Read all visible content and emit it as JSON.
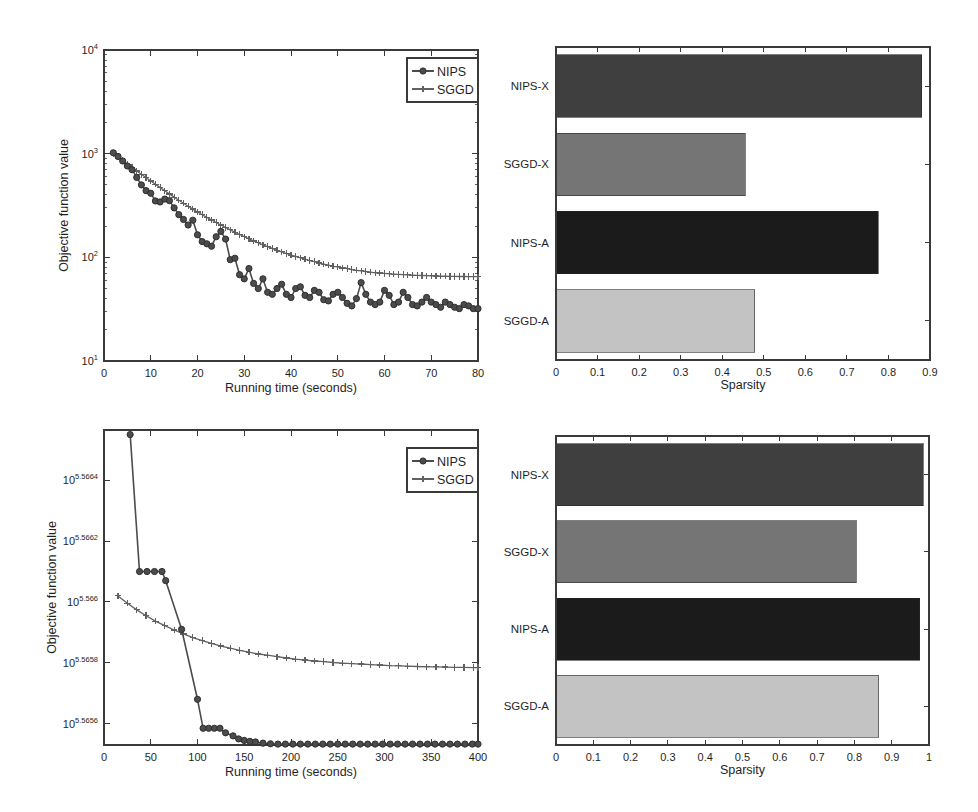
{
  "figure": {
    "background": "#ffffff",
    "text_color": "#1f1f1f",
    "frame_color": "#3a3a3a",
    "legend_labels": [
      "NIPS",
      "SGGD"
    ]
  },
  "chart_data": [
    {
      "id": "objective-vs-time-top",
      "position": "top-left",
      "type": "line",
      "xlabel": "Running time (seconds)",
      "ylabel": "Objective function value",
      "xlim": [
        0,
        80
      ],
      "xticks": [
        0,
        10,
        20,
        30,
        40,
        50,
        60,
        70,
        80
      ],
      "xtick_labels": [
        "0",
        "10",
        "20",
        "30",
        "40",
        "50",
        "60",
        "70",
        "80"
      ],
      "yscale": "log",
      "ylim_exponents": [
        1,
        4
      ],
      "ytick_exponents": [
        1,
        2,
        3,
        4
      ],
      "ytick_exponent_labels": [
        "1",
        "2",
        "3",
        "4"
      ],
      "log_minor_ticks": true,
      "legend_position": "top-right",
      "series": [
        {
          "name": "SGGD",
          "marker": "plus",
          "color": "#616161",
          "x": [
            2,
            3,
            4,
            5,
            6,
            7,
            8,
            9,
            10,
            11,
            12,
            13,
            14,
            15,
            16,
            17,
            18,
            19,
            20,
            21,
            22,
            23,
            24,
            25,
            26,
            27,
            28,
            29,
            30,
            31,
            32,
            33,
            34,
            35,
            36,
            37,
            38,
            39,
            40,
            41,
            42,
            43,
            44,
            45,
            46,
            47,
            48,
            49,
            50,
            51,
            52,
            53,
            54,
            55,
            56,
            57,
            58,
            59,
            60,
            61,
            62,
            63,
            64,
            65,
            66,
            67,
            68,
            69,
            70,
            71,
            72,
            73,
            74,
            75,
            76,
            77,
            78,
            79,
            80
          ],
          "y": [
            1000,
            925,
            857,
            793,
            735,
            681,
            632,
            587,
            545,
            507,
            471,
            439,
            409,
            381,
            356,
            333,
            311,
            292,
            274,
            258,
            243,
            229,
            217,
            205,
            194,
            184,
            175,
            166,
            158,
            151,
            144,
            138,
            132,
            127,
            122,
            117,
            113,
            109,
            105,
            102,
            99,
            96,
            93,
            91,
            88,
            86,
            84,
            82,
            81,
            79,
            78,
            76,
            75,
            74,
            73,
            72,
            71,
            70.5,
            70,
            69.4,
            68.9,
            68.5,
            68,
            67.7,
            67.3,
            67,
            66.8,
            66.5,
            66.3,
            66.1,
            65.9,
            65.8,
            65.6,
            65.5,
            65.4,
            65.3,
            65.2,
            65.1,
            65
          ]
        },
        {
          "name": "NIPS",
          "marker": "circle",
          "color": "#4c4c4c",
          "x": [
            2,
            3,
            4,
            5,
            6,
            7,
            8,
            9,
            10,
            11,
            12,
            13,
            14,
            15,
            16,
            17,
            18,
            19,
            20,
            21,
            22,
            23,
            24,
            25,
            26,
            27,
            28,
            29,
            30,
            31,
            32,
            33,
            34,
            35,
            36,
            37,
            38,
            39,
            40,
            41,
            42,
            43,
            44,
            45,
            46,
            47,
            48,
            49,
            50,
            51,
            52,
            53,
            54,
            55,
            56,
            57,
            58,
            59,
            60,
            61,
            62,
            63,
            64,
            65,
            66,
            67,
            68,
            69,
            70,
            71,
            72,
            73,
            74,
            75,
            76,
            77,
            78,
            79,
            80
          ],
          "y": [
            1020,
            940,
            850,
            760,
            700,
            590,
            500,
            440,
            415,
            350,
            342,
            365,
            352,
            300,
            258,
            232,
            205,
            228,
            165,
            142,
            135,
            128,
            158,
            178,
            150,
            95,
            98,
            68,
            62,
            78,
            56,
            50,
            62,
            46,
            44,
            50,
            55,
            44,
            41,
            50,
            52,
            43,
            41,
            48,
            46,
            39,
            38,
            44,
            46,
            41,
            36,
            34,
            40,
            57,
            44,
            37,
            35,
            37,
            48,
            43,
            35,
            37,
            46,
            41,
            35,
            34,
            37,
            41,
            37,
            35,
            33,
            37,
            35,
            33,
            32,
            35,
            34,
            32,
            32
          ]
        }
      ]
    },
    {
      "id": "sparsity-top",
      "position": "top-right",
      "type": "bar",
      "orientation": "horizontal",
      "xlabel": "Sparsity",
      "xlim": [
        0,
        0.9
      ],
      "xticks": [
        0,
        0.1,
        0.2,
        0.3,
        0.4,
        0.5,
        0.6,
        0.7,
        0.8,
        0.9
      ],
      "xtick_labels": [
        "0",
        "0.1",
        "0.2",
        "0.3",
        "0.4",
        "0.5",
        "0.6",
        "0.7",
        "0.8",
        "0.9"
      ],
      "categories": [
        "NIPS-X",
        "SGGD-X",
        "NIPS-A",
        "SGGD-A"
      ],
      "values": [
        0.88,
        0.455,
        0.775,
        0.478
      ],
      "bar_colors": [
        "#3f3f3f",
        "#757575",
        "#1b1b1b",
        "#c3c3c3"
      ]
    },
    {
      "id": "objective-vs-time-bottom",
      "position": "bottom-left",
      "type": "line",
      "xlabel": "Running time (seconds)",
      "ylabel": "Objective function value",
      "xlim": [
        0,
        400
      ],
      "xticks": [
        0,
        50,
        100,
        150,
        200,
        250,
        300,
        350,
        400
      ],
      "xtick_labels": [
        "0",
        "50",
        "100",
        "150",
        "200",
        "250",
        "300",
        "350",
        "400"
      ],
      "yscale": "log",
      "ylim_exponents": [
        5.56553,
        5.566565
      ],
      "ytick_exponents": [
        5.5656,
        5.5658,
        5.566,
        5.5662,
        5.5664
      ],
      "ytick_exponent_labels": [
        "5.5656",
        "5.5658",
        "5.566",
        "5.5662",
        "5.5664"
      ],
      "log_minor_ticks": false,
      "legend_position": "top-right",
      "series": [
        {
          "name": "SGGD",
          "marker": "plus",
          "color": "#616161",
          "x": [
            15,
            25,
            35,
            45,
            55,
            65,
            75,
            85,
            95,
            105,
            115,
            125,
            135,
            145,
            155,
            165,
            175,
            185,
            195,
            205,
            215,
            225,
            235,
            245,
            255,
            265,
            275,
            285,
            295,
            305,
            315,
            325,
            335,
            345,
            355,
            365,
            375,
            385,
            395,
            400
          ],
          "y_exponent": [
            5.56602,
            5.565996,
            5.565974,
            5.565955,
            5.565937,
            5.565922,
            5.565908,
            5.565895,
            5.565883,
            5.565873,
            5.565864,
            5.565855,
            5.565848,
            5.565841,
            5.565835,
            5.565829,
            5.565825,
            5.56582,
            5.565816,
            5.565812,
            5.565809,
            5.565806,
            5.565804,
            5.565801,
            5.565799,
            5.565797,
            5.565796,
            5.565794,
            5.565793,
            5.565791,
            5.56579,
            5.565789,
            5.565788,
            5.565787,
            5.565787,
            5.565786,
            5.565785,
            5.565785,
            5.565784,
            5.565784
          ]
        },
        {
          "name": "NIPS",
          "marker": "circle",
          "color": "#4c4c4c",
          "x": [
            28,
            38,
            46,
            54,
            62,
            66,
            83,
            100,
            106,
            112,
            118,
            124,
            130,
            138,
            144,
            150,
            156,
            162,
            170,
            178,
            186,
            194,
            202,
            210,
            218,
            226,
            234,
            242,
            250,
            258,
            266,
            274,
            282,
            290,
            298,
            306,
            314,
            322,
            330,
            338,
            346,
            354,
            362,
            370,
            378,
            386,
            394,
            400
          ],
          "y_exponent": [
            5.56655,
            5.5661,
            5.5661,
            5.5661,
            5.5661,
            5.56607,
            5.56591,
            5.56568,
            5.565585,
            5.565585,
            5.565585,
            5.565585,
            5.56557,
            5.56556,
            5.56555,
            5.565545,
            5.565542,
            5.56554,
            5.565536,
            5.565534,
            5.565533,
            5.565533,
            5.565533,
            5.565533,
            5.565533,
            5.565533,
            5.565533,
            5.565533,
            5.565533,
            5.565533,
            5.565533,
            5.565533,
            5.565533,
            5.565533,
            5.565533,
            5.565533,
            5.565533,
            5.565533,
            5.565533,
            5.565533,
            5.565533,
            5.565533,
            5.565533,
            5.565533,
            5.565533,
            5.565533,
            5.565533,
            5.565533
          ]
        }
      ]
    },
    {
      "id": "sparsity-bottom",
      "position": "bottom-right",
      "type": "bar",
      "orientation": "horizontal",
      "xlabel": "Sparsity",
      "xlim": [
        0,
        1
      ],
      "xticks": [
        0,
        0.1,
        0.2,
        0.3,
        0.4,
        0.5,
        0.6,
        0.7,
        0.8,
        0.9,
        1
      ],
      "xtick_labels": [
        "0",
        "0.1",
        "0.2",
        "0.3",
        "0.4",
        "0.5",
        "0.6",
        "0.7",
        "0.8",
        "0.9",
        "1"
      ],
      "categories": [
        "NIPS-X",
        "SGGD-X",
        "NIPS-A",
        "SGGD-A"
      ],
      "values": [
        0.985,
        0.805,
        0.975,
        0.865
      ],
      "bar_colors": [
        "#3f3f3f",
        "#757575",
        "#1b1b1b",
        "#c3c3c3"
      ]
    }
  ]
}
